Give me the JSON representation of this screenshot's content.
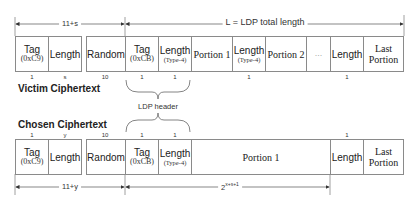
{
  "top_dimension": {
    "left_label": "11+s",
    "right_label": "L = LDP total length"
  },
  "victim": {
    "title": "Victim Ciphertext",
    "fields": [
      {
        "name": "Tag",
        "sub": "(0xC9)",
        "size": "1"
      },
      {
        "name": "Length",
        "sub": "",
        "size": "s"
      },
      {
        "name": "Random",
        "sub": "",
        "size": "10"
      },
      {
        "name": "Tag",
        "sub": "(0xCB)",
        "size": "1"
      },
      {
        "name": "Length",
        "sub": "(Type-4)",
        "size": "1"
      },
      {
        "name": "Portion 1",
        "sub": "",
        "size": ""
      },
      {
        "name": "Length",
        "sub": "(Type-4)",
        "size": "1"
      },
      {
        "name": "Portion 2",
        "sub": "",
        "size": ""
      },
      {
        "name": "...",
        "sub": "",
        "size": ""
      },
      {
        "name": "Length",
        "sub": "",
        "size": "1"
      },
      {
        "name": "Last",
        "sub": "Portion",
        "size": ""
      }
    ]
  },
  "ldp_header_label": "LDP header",
  "chosen": {
    "title": "Chosen Ciphertext",
    "fields": [
      {
        "name": "Tag",
        "sub": "(0xC9)",
        "size": "1"
      },
      {
        "name": "Length",
        "sub": "",
        "size": "y"
      },
      {
        "name": "Random",
        "sub": "",
        "size": "10"
      },
      {
        "name": "Tag",
        "sub": "(0xCB)",
        "size": "1"
      },
      {
        "name": "Length",
        "sub": "(Type-4)",
        "size": "1"
      },
      {
        "name": "Portion 1",
        "sub": "",
        "size": ""
      },
      {
        "name": "Length",
        "sub": "",
        "size": "1"
      },
      {
        "name": "Last",
        "sub": "Portion",
        "size": ""
      }
    ]
  },
  "bottom_dimension": {
    "left_label": "11+y",
    "right_label_base": "2",
    "right_label_exp": "x+s+1"
  }
}
